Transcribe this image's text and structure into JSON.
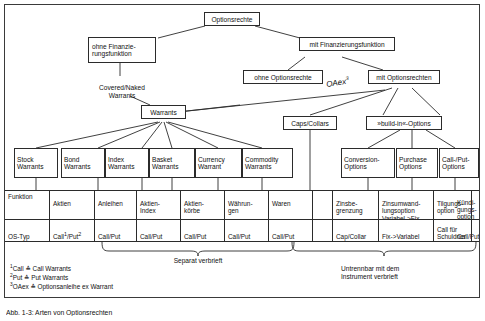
{
  "figure": {
    "root": {
      "label": "Optionsrechte"
    },
    "level1": [
      {
        "label": "ohne Finanzie-\nrungsfunktion"
      },
      {
        "label": "mit Finanzierungsfunktion"
      }
    ],
    "level2": [
      {
        "label": "ohne Optionsrechte"
      },
      {
        "label": "mit Optionsrechten"
      }
    ],
    "annotation": {
      "text": "OAex",
      "superscript": "3"
    },
    "free_labels": [
      {
        "label": "Covered/Naked\nWarrants"
      }
    ],
    "level3": [
      {
        "label": "Warrants"
      },
      {
        "label": "Caps/Collars"
      },
      {
        "label": "»build-in«-Options"
      }
    ],
    "leaves": [
      {
        "label": "Stock\nWarrants"
      },
      {
        "label": "Bond\nWarrants"
      },
      {
        "label": "Index\nWarrants"
      },
      {
        "label": "Basket\nWarrants"
      },
      {
        "label": "Currency\nWarrant"
      },
      {
        "label": "Commodity\nWarrants"
      },
      {
        "label": "Conversion-\nOptions"
      },
      {
        "label": "Purchase\nOptions"
      },
      {
        "label": "Call-/Put-\nOptions"
      }
    ],
    "table": {
      "row_labels": {
        "funktion": "Funktion",
        "os_typ": "OS-Typ"
      },
      "columns": [
        {
          "funktion": "Aktien",
          "os_typ": "Call¹/Put²"
        },
        {
          "funktion": "Anleihen",
          "os_typ": "Call/Put"
        },
        {
          "funktion": "Aktien-\nIndex",
          "os_typ": "Call/Put"
        },
        {
          "funktion": "Aktien-\nkörbe",
          "os_typ": "Call/Put"
        },
        {
          "funktion": "Währun-\ngen",
          "os_typ": "Call/Put"
        },
        {
          "funktion": "Waren",
          "os_typ": "Call/Put"
        },
        {
          "funktion": "",
          "os_typ": ""
        },
        {
          "funktion": "Zinsbe-\ngrenzung",
          "os_typ": "Cap/Collar"
        },
        {
          "funktion": "Zinsumwand-\nlungsoption\nVariabel->Fix",
          "os_typ": "Fix->Variabel"
        },
        {
          "funktion": "Tilgungs-\noption",
          "os_typ": "Call für\nSchuldner"
        },
        {
          "funktion": "Kündi-\ngungs-\noption",
          "os_typ": "Call/Put"
        }
      ]
    },
    "braces": [
      {
        "label": "Separat verbrieft"
      },
      {
        "label": "Untrennbar mit dem\nInstrument verbrieft"
      }
    ],
    "footnotes": [
      {
        "marker": "1",
        "text": "Call ≙ Call Warrants"
      },
      {
        "marker": "2",
        "text": "Put ≙ Put Warrants"
      },
      {
        "marker": "3",
        "text": "OAex ≙ Optionsanleihe ex Warrant"
      }
    ],
    "caption": "Abb. 1-3: Arten von Optionsrechten",
    "colors": {
      "line": "#2b2b2b",
      "frame": "#3a3a3a",
      "background": "#ffffff"
    }
  }
}
